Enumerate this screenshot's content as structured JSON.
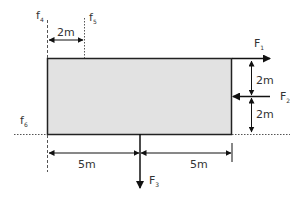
{
  "diagram": {
    "type": "force diagram on rectangular body",
    "colors": {
      "body_fill": "#e2e2e2",
      "stroke": "#222222",
      "text": "#333333"
    },
    "body": {
      "label": "rectangle"
    },
    "forces": [
      {
        "id": "F1",
        "main": "F",
        "sub": "1",
        "direction": "right",
        "position": "top edge, right corner"
      },
      {
        "id": "F2",
        "main": "F",
        "sub": "2",
        "direction": "left",
        "position": "right edge, mid height"
      },
      {
        "id": "F3",
        "main": "F",
        "sub": "3",
        "direction": "down",
        "position": "bottom edge, midpoint"
      }
    ],
    "lines_of_action": [
      {
        "id": "f4",
        "main": "f",
        "sub": "4",
        "orientation": "vertical",
        "position": "left edge"
      },
      {
        "id": "f5",
        "main": "f",
        "sub": "5",
        "orientation": "vertical",
        "position": "2m right of left edge"
      },
      {
        "id": "f6",
        "main": "f",
        "sub": "6",
        "orientation": "horizontal",
        "position": "bottom edge"
      }
    ],
    "dimensions": {
      "top_left": "2m",
      "right_upper": "2m",
      "right_lower": "2m",
      "bottom_left": "5m",
      "bottom_right": "5m"
    }
  }
}
